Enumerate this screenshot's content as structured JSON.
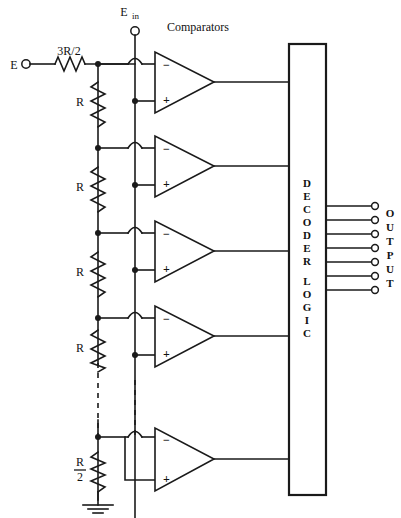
{
  "figure": {
    "type": "circuit-schematic"
  },
  "labels": {
    "reference_input": "E",
    "signal_input": "E",
    "signal_input_sub": "in",
    "comparators_heading": "Comparators",
    "top_resistor": "3R/2",
    "ladder_resistor": "R",
    "bottom_resistor_num": "R",
    "bottom_resistor_den": "2",
    "minus_sign": "−",
    "plus_sign": "+"
  },
  "decoder": {
    "text_lines": [
      "D",
      "E",
      "C",
      "O",
      "D",
      "E",
      "R",
      "",
      "L",
      "O",
      "G",
      "I",
      "C"
    ],
    "full_label": "DECODER LOGIC"
  },
  "output": {
    "text_lines": [
      "O",
      "U",
      "T",
      "P",
      "U",
      "T"
    ],
    "full_label": "OUTPUT",
    "line_count": 7
  },
  "colors": {
    "ink": "#1a1a1a",
    "background": "#ffffff"
  },
  "geometry": {
    "ladder_x": 98,
    "ein_x": 135,
    "comparator_count": 5,
    "ladder_taps": [
      64,
      148,
      233,
      318,
      437
    ]
  }
}
